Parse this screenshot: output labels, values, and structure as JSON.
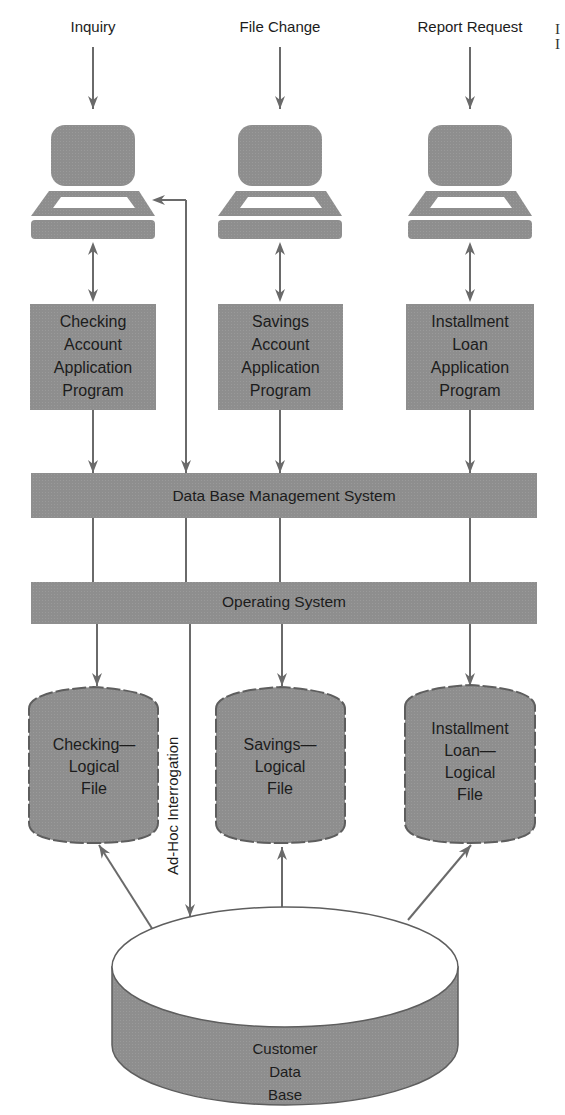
{
  "colors": {
    "fill": "#8e8e8e",
    "stroke": "#666666",
    "line": "#6a6a6a",
    "text": "#1c1c1c",
    "background": "#ffffff"
  },
  "inputs": [
    {
      "label": "Inquiry",
      "x": 93
    },
    {
      "label": "File Change",
      "x": 280
    },
    {
      "label": "Report Request",
      "x": 470
    }
  ],
  "terminals": [
    {
      "name": "terminal-inquiry",
      "icon": "computer-terminal-icon",
      "x": 93
    },
    {
      "name": "terminal-file-change",
      "icon": "computer-terminal-icon",
      "x": 280
    },
    {
      "name": "terminal-report-request",
      "icon": "computer-terminal-icon",
      "x": 470
    }
  ],
  "programs": [
    {
      "lines": [
        "Checking",
        "Account",
        "Application",
        "Program"
      ],
      "x": 93
    },
    {
      "lines": [
        "Savings",
        "Account",
        "Application",
        "Program"
      ],
      "x": 280
    },
    {
      "lines": [
        "Installment",
        "Loan",
        "Application",
        "Program"
      ],
      "x": 470
    }
  ],
  "dbms": {
    "label": "Data Base Management System"
  },
  "os": {
    "label": "Operating System"
  },
  "logical_files": [
    {
      "lines": [
        "Checking—",
        "Logical",
        "File"
      ],
      "x": 97
    },
    {
      "lines": [
        "Savings—",
        "Logical",
        "File"
      ],
      "x": 282
    },
    {
      "lines": [
        "Installment",
        "Loan—",
        "Logical",
        "File"
      ],
      "x": 470
    }
  ],
  "ad_hoc": {
    "label": "Ad-Hoc Interrogation"
  },
  "database": {
    "lines": [
      "Customer",
      "Data",
      "Base"
    ]
  },
  "corner_marks": [
    "I",
    "I"
  ]
}
